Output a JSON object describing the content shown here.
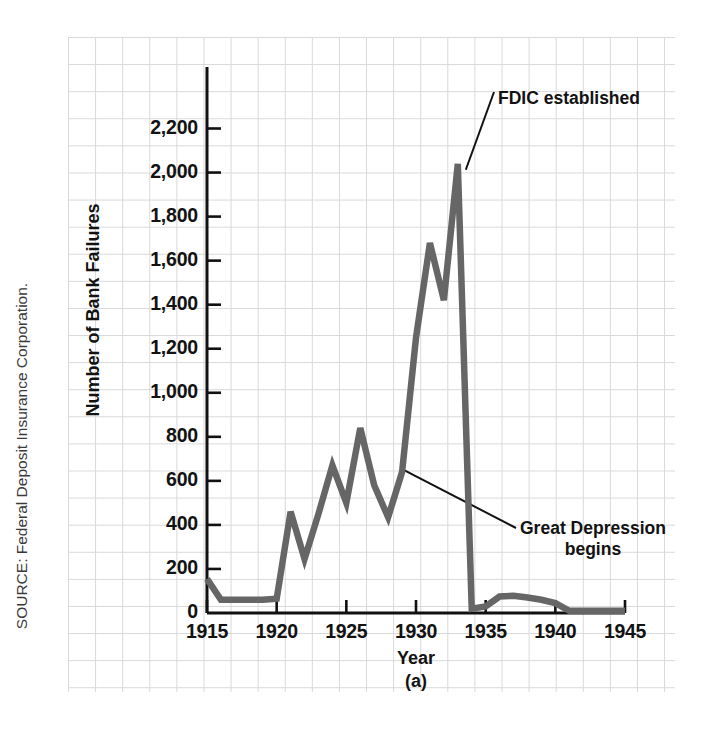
{
  "figure": {
    "source_note": "SOURCE: Federal Deposit Insurance Corporation.",
    "panel_letter": "(a)"
  },
  "chart_data": {
    "type": "line",
    "title": "",
    "xlabel": "Year",
    "ylabel": "Number of Bank Failures",
    "xlim": [
      1915,
      1945
    ],
    "ylim": [
      0,
      2300
    ],
    "grid": true,
    "legend": "none",
    "x_ticks": [
      "1915",
      "1920",
      "1925",
      "1930",
      "1935",
      "1940",
      "1945"
    ],
    "x_tick_values": [
      1915,
      1920,
      1925,
      1930,
      1935,
      1940,
      1945
    ],
    "y_ticks": [
      "0",
      "200",
      "400",
      "600",
      "800",
      "1,000",
      "1,200",
      "1,400",
      "1,600",
      "1,800",
      "2,000",
      "2,200"
    ],
    "y_tick_values": [
      0,
      200,
      400,
      600,
      800,
      1000,
      1200,
      1400,
      1600,
      1800,
      2000,
      2200
    ],
    "line_color": "#666666",
    "x": [
      1915,
      1916,
      1917,
      1918,
      1919,
      1920,
      1921,
      1922,
      1923,
      1924,
      1925,
      1926,
      1927,
      1928,
      1929,
      1930,
      1931,
      1932,
      1933,
      1934,
      1935,
      1936,
      1937,
      1938,
      1939,
      1940,
      1941,
      1942,
      1943,
      1944,
      1945
    ],
    "values": [
      155,
      60,
      60,
      60,
      60,
      65,
      460,
      245,
      450,
      670,
      500,
      840,
      580,
      435,
      640,
      1250,
      1680,
      1420,
      2040,
      20,
      30,
      75,
      78,
      70,
      60,
      45,
      10,
      10,
      10,
      10,
      10
    ],
    "annotations": [
      {
        "id": "fdic",
        "text": "FDIC established",
        "points_to_year": 1933,
        "points_to_value": 2040
      },
      {
        "id": "great-depression",
        "line1": "Great Depression",
        "line2": "begins",
        "points_to_year": 1929,
        "points_to_value": 640
      }
    ]
  }
}
